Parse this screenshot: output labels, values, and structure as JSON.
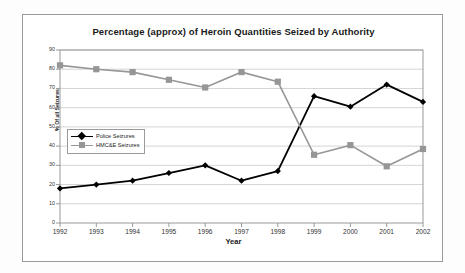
{
  "chart_data": {
    "type": "line",
    "title": "Percentage (approx) of Heroin Quantities Seized by Authority",
    "xlabel": "Year",
    "ylabel": "% Of all Seizures",
    "categories": [
      "1992",
      "1993",
      "1994",
      "1995",
      "1996",
      "1997",
      "1998",
      "1999",
      "2000",
      "2001",
      "2002"
    ],
    "yticks": [
      "0",
      "10",
      "20",
      "30",
      "40",
      "50",
      "60",
      "70",
      "80",
      "90"
    ],
    "ylim": [
      0,
      90
    ],
    "grid": true,
    "legend_position": "inside-left",
    "series": [
      {
        "name": "Police Seizures",
        "color": "#000000",
        "marker": "diamond",
        "values": [
          18,
          20,
          22,
          26,
          30,
          22,
          27,
          66,
          60.5,
          72,
          63
        ]
      },
      {
        "name": "HMC&E Seizures",
        "color": "#969696",
        "marker": "square",
        "values": [
          82,
          80,
          78.5,
          74.5,
          70.5,
          78.5,
          73.5,
          35.5,
          40.5,
          29.5,
          38.5
        ]
      }
    ]
  }
}
